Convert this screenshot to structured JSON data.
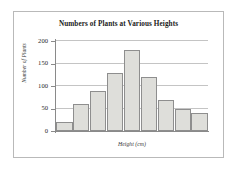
{
  "chart_data": {
    "type": "bar",
    "title": "Numbers of Plants at Various Heights",
    "xlabel": "Height (cm)",
    "ylabel": "Number of Plants",
    "categories": [
      "1",
      "2",
      "3",
      "4",
      "5",
      "6",
      "7",
      "8",
      "9"
    ],
    "values": [
      20,
      60,
      90,
      130,
      180,
      120,
      70,
      50,
      40
    ],
    "ylim": [
      0,
      200
    ],
    "yticks": [
      0,
      50,
      100,
      150,
      200
    ],
    "ytick_labels": [
      "0",
      "50",
      "100",
      "150",
      "200"
    ],
    "xtick_labels": [],
    "grid": true,
    "grid_axis": "y",
    "legend": false,
    "legend_position": "none",
    "bar_fill_color": "#dededa",
    "bar_edge_color": "#8e8e8e",
    "gridline_color": "#c4c4c4",
    "axis_color": "#8a8a8a",
    "frame_color": "#b9b9b9",
    "background_color": "#ffffff"
  }
}
